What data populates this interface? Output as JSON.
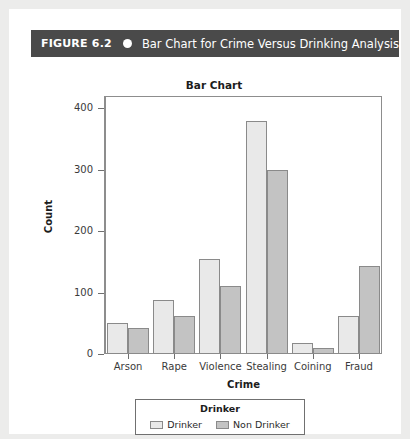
{
  "figure": {
    "number_label": "FIGURE 6.2",
    "bullet_icon": "filled-circle-icon",
    "caption": "Bar Chart for Crime Versus Drinking Analysis"
  },
  "chart_data": {
    "type": "bar",
    "title": "Bar Chart",
    "xlabel": "Crime",
    "ylabel": "Count",
    "categories": [
      "Arson",
      "Rape",
      "Violence",
      "Stealing",
      "Coining",
      "Fraud"
    ],
    "series": [
      {
        "name": "Drinker",
        "color": "#e9e9e9",
        "values": [
          50,
          88,
          155,
          380,
          18,
          62
        ]
      },
      {
        "name": "Non Drinker",
        "color": "#c3c3c3",
        "values": [
          42,
          62,
          110,
          300,
          10,
          144
        ]
      }
    ],
    "ylim": [
      0,
      420
    ],
    "yticks": [
      0,
      100,
      200,
      300,
      400
    ],
    "ytick_labels": [
      "0",
      "100",
      "200",
      "300",
      "400"
    ],
    "grid": false,
    "legend": {
      "title": "Drinker",
      "position": "bottom",
      "entries": [
        "Drinker",
        "Non Drinker"
      ]
    }
  },
  "colors": {
    "header_bar": "#4a4a4a",
    "page_background": "#ffffff",
    "outer_background": "#ececeb",
    "axis": "#8d8d8d"
  }
}
